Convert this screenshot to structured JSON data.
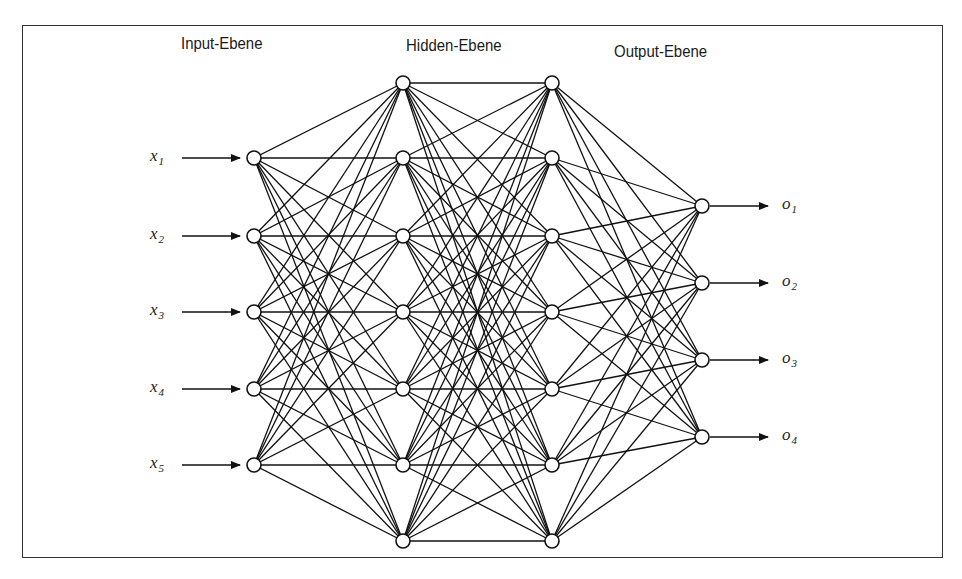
{
  "diagram": {
    "type": "feedforward-neural-network",
    "layer_titles": [
      {
        "text": "Input-Ebene",
        "x": 181,
        "y": 34
      },
      {
        "text": "Hidden-Ebene",
        "x": 406,
        "y": 36
      },
      {
        "text": "Output-Ebene",
        "x": 614,
        "y": 42
      }
    ],
    "colors": {
      "line": "#111111",
      "node_fill": "#ffffff",
      "node_stroke": "#111111",
      "frame": "#333333",
      "background": "#ffffff"
    },
    "layers": [
      {
        "name": "input",
        "x": 254,
        "y": [
          158,
          236,
          312,
          389,
          465
        ]
      },
      {
        "name": "hidden-1",
        "x": 403,
        "y": [
          83,
          158,
          236,
          312,
          389,
          465,
          541
        ]
      },
      {
        "name": "hidden-2",
        "x": 552,
        "y": [
          83,
          158,
          236,
          312,
          389,
          465,
          541
        ]
      },
      {
        "name": "output",
        "x": 702,
        "y": [
          206,
          283,
          360,
          437
        ]
      }
    ],
    "node_radius": 7,
    "inputs": [
      {
        "var": "x",
        "sub": "1"
      },
      {
        "var": "x",
        "sub": "2"
      },
      {
        "var": "x",
        "sub": "3"
      },
      {
        "var": "x",
        "sub": "4"
      },
      {
        "var": "x",
        "sub": "5"
      }
    ],
    "outputs": [
      {
        "var": "o",
        "sub": "1"
      },
      {
        "var": "o",
        "sub": "2"
      },
      {
        "var": "o",
        "sub": "3"
      },
      {
        "var": "o",
        "sub": "4"
      }
    ],
    "input_arrow": {
      "x_start": 182,
      "x_end": 240,
      "label_x": 150
    },
    "output_arrow": {
      "x_start": 710,
      "x_end": 768,
      "label_x": 782
    },
    "hidden_1_to_2_horizontal_links": true
  }
}
